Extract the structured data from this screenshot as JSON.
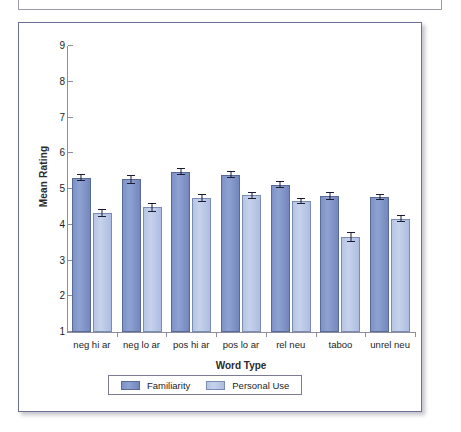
{
  "chart_data": {
    "type": "bar",
    "title": "",
    "xlabel": "Word Type",
    "ylabel": "Mean Rating",
    "ylim": [
      1,
      9
    ],
    "yticks": [
      1,
      2,
      3,
      4,
      5,
      6,
      7,
      8,
      9
    ],
    "grid": false,
    "legend_position": "bottom",
    "categories": [
      "neg hi ar",
      "neg lo ar",
      "pos hi ar",
      "pos lo ar",
      "rel neu",
      "taboo",
      "unrel neu"
    ],
    "series": [
      {
        "name": "Familiarity",
        "color": "#8094c8",
        "values": [
          5.32,
          5.27,
          5.48,
          5.4,
          5.12,
          4.8,
          4.77
        ],
        "errors": [
          0.1,
          0.12,
          0.1,
          0.09,
          0.09,
          0.11,
          0.09
        ]
      },
      {
        "name": "Personal Use",
        "color": "#bccae6",
        "values": [
          4.33,
          4.49,
          4.75,
          4.82,
          4.67,
          3.66,
          4.17
        ],
        "errors": [
          0.1,
          0.13,
          0.12,
          0.1,
          0.08,
          0.13,
          0.09
        ]
      }
    ]
  },
  "legend": {
    "entries": [
      {
        "label": "Familiarity"
      },
      {
        "label": "Personal Use"
      }
    ]
  }
}
